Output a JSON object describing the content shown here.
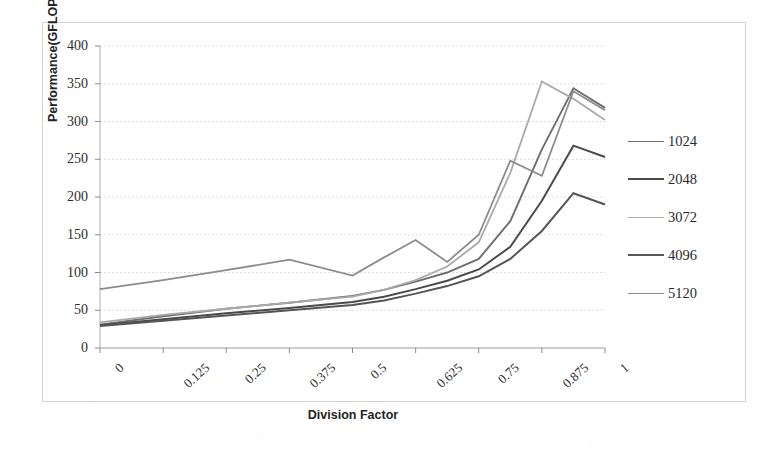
{
  "chart_data": {
    "type": "line",
    "title": "",
    "xlabel": "Division Factor",
    "ylabel": "Performance(GFLOPS)",
    "x": [
      0,
      0.125,
      0.25,
      0.375,
      0.5,
      0.5625,
      0.625,
      0.6875,
      0.75,
      0.8125,
      0.875,
      0.9375,
      1
    ],
    "xticklabels": [
      "0",
      "0.125",
      "0.25",
      "0.375",
      "0.5",
      "0.625",
      "0.75",
      "0.875",
      "1"
    ],
    "xticks": [
      0,
      0.125,
      0.25,
      0.375,
      0.5,
      0.625,
      0.75,
      0.875,
      1
    ],
    "xlim": [
      0,
      1
    ],
    "ylim": [
      0,
      400
    ],
    "yticks": [
      0,
      50,
      100,
      150,
      200,
      250,
      300,
      350,
      400
    ],
    "yticklabels": [
      "0",
      "50",
      "100",
      "150",
      "200",
      "250",
      "300",
      "350",
      "400"
    ],
    "grid": true,
    "grid_axis": "y",
    "legend_position": "right",
    "series": [
      {
        "name": "1024",
        "color": "#6e6e6e",
        "width": 1.9,
        "values": [
          31,
          42,
          52,
          60,
          69,
          77,
          88,
          100,
          118,
          168,
          263,
          344,
          318
        ]
      },
      {
        "name": "2048",
        "color": "#4a4a4a",
        "width": 2.0,
        "values": [
          30,
          38,
          46,
          53,
          61,
          68,
          78,
          89,
          104,
          134,
          195,
          268,
          253
        ]
      },
      {
        "name": "3072",
        "color": "#aaaaaa",
        "width": 1.8,
        "values": [
          34,
          44,
          52,
          60,
          68,
          77,
          90,
          108,
          140,
          232,
          353,
          330,
          302
        ]
      },
      {
        "name": "4096",
        "color": "#555555",
        "width": 2.0,
        "values": [
          29,
          36,
          43,
          50,
          57,
          63,
          72,
          82,
          95,
          118,
          155,
          205,
          190
        ]
      },
      {
        "name": "5120",
        "color": "#8c8c8c",
        "width": 1.8,
        "values": [
          78,
          90,
          103,
          117,
          96,
          120,
          143,
          114,
          150,
          248,
          228,
          340,
          315
        ]
      }
    ]
  },
  "legend": {
    "entries": [
      "1024",
      "2048",
      "3072",
      "4096",
      "5120"
    ]
  }
}
